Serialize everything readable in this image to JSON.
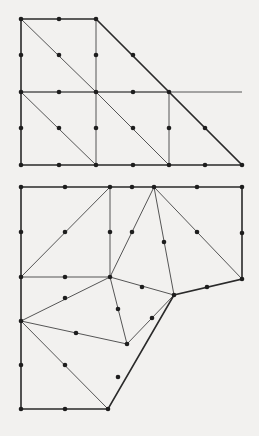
{
  "colors": {
    "background": "#f2f1ef",
    "edge": "#555555",
    "boundary": "#2a2a2a",
    "node": "#1e1e1e"
  },
  "meshes": [
    {
      "name": "structured-triangular-mesh",
      "boundary": [
        [
          21,
          19
        ],
        [
          96,
          19
        ],
        [
          242,
          165
        ],
        [
          21,
          165
        ]
      ],
      "edges": [
        [
          [
            21,
            92
          ],
          [
            242,
            92
          ]
        ],
        [
          [
            21,
            92
          ],
          [
            169,
            92
          ]
        ],
        [
          [
            96,
            19
          ],
          [
            96,
            165
          ]
        ],
        [
          [
            169,
            92
          ],
          [
            169,
            165
          ]
        ],
        [
          [
            21,
            19
          ],
          [
            96,
            92
          ]
        ],
        [
          [
            96,
            92
          ],
          [
            169,
            165
          ]
        ],
        [
          [
            21,
            92
          ],
          [
            96,
            165
          ]
        ],
        [
          [
            96,
            92
          ],
          [
            169,
            165
          ]
        ]
      ],
      "nodes": [
        [
          21,
          19
        ],
        [
          59,
          19
        ],
        [
          96,
          19
        ],
        [
          21,
          55
        ],
        [
          59,
          55
        ],
        [
          96,
          55
        ],
        [
          133,
          55
        ],
        [
          21,
          92
        ],
        [
          59,
          92
        ],
        [
          96,
          92
        ],
        [
          133,
          92
        ],
        [
          169,
          92
        ],
        [
          21,
          128
        ],
        [
          59,
          128
        ],
        [
          96,
          128
        ],
        [
          133,
          128
        ],
        [
          169,
          128
        ],
        [
          205,
          128
        ],
        [
          21,
          165
        ],
        [
          59,
          165
        ],
        [
          96,
          165
        ],
        [
          133,
          165
        ],
        [
          169,
          165
        ],
        [
          205,
          165
        ],
        [
          242,
          165
        ]
      ]
    },
    {
      "name": "unstructured-triangular-mesh",
      "boundary": [
        [
          21,
          187
        ],
        [
          242,
          187
        ],
        [
          242,
          279
        ],
        [
          174,
          295
        ],
        [
          108,
          409
        ],
        [
          21,
          409
        ]
      ],
      "edges": [
        [
          [
            21,
            277
          ],
          [
            110,
            277
          ]
        ],
        [
          [
            110,
            187
          ],
          [
            110,
            277
          ]
        ],
        [
          [
            21,
            277
          ],
          [
            110,
            187
          ]
        ],
        [
          [
            110,
            277
          ],
          [
            154,
            187
          ]
        ],
        [
          [
            154,
            187
          ],
          [
            174,
            295
          ]
        ],
        [
          [
            154,
            187
          ],
          [
            242,
            279
          ]
        ],
        [
          [
            110,
            277
          ],
          [
            174,
            295
          ]
        ],
        [
          [
            21,
            321
          ],
          [
            110,
            277
          ]
        ],
        [
          [
            110,
            277
          ],
          [
            127,
            344
          ]
        ],
        [
          [
            21,
            321
          ],
          [
            127,
            344
          ]
        ],
        [
          [
            21,
            321
          ],
          [
            108,
            409
          ]
        ],
        [
          [
            127,
            344
          ],
          [
            174,
            295
          ]
        ]
      ],
      "nodes": [
        [
          21,
          187
        ],
        [
          65,
          187
        ],
        [
          110,
          187
        ],
        [
          132,
          187
        ],
        [
          154,
          187
        ],
        [
          197,
          187
        ],
        [
          242,
          187
        ],
        [
          21,
          232
        ],
        [
          65,
          232
        ],
        [
          110,
          232
        ],
        [
          132,
          232
        ],
        [
          164,
          242
        ],
        [
          197,
          232
        ],
        [
          242,
          233
        ],
        [
          21,
          277
        ],
        [
          65,
          277
        ],
        [
          110,
          277
        ],
        [
          242,
          279
        ],
        [
          142,
          287
        ],
        [
          207,
          287
        ],
        [
          174,
          295
        ],
        [
          65,
          298
        ],
        [
          118,
          309
        ],
        [
          152,
          318
        ],
        [
          21,
          321
        ],
        [
          76,
          333
        ],
        [
          127,
          344
        ],
        [
          21,
          365
        ],
        [
          65,
          365
        ],
        [
          118,
          377
        ],
        [
          21,
          409
        ],
        [
          65,
          409
        ],
        [
          108,
          409
        ]
      ]
    }
  ]
}
